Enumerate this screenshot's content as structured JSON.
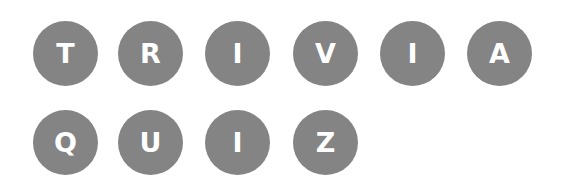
{
  "colors": {
    "tile": "#848484",
    "letter": "#ffffff",
    "background": "#ffffff"
  },
  "rows": [
    {
      "word": "TRIVIA",
      "letters": [
        "T",
        "R",
        "I",
        "V",
        "I",
        "A"
      ]
    },
    {
      "word": "QUIZ",
      "letters": [
        "Q",
        "U",
        "I",
        "Z"
      ]
    }
  ]
}
